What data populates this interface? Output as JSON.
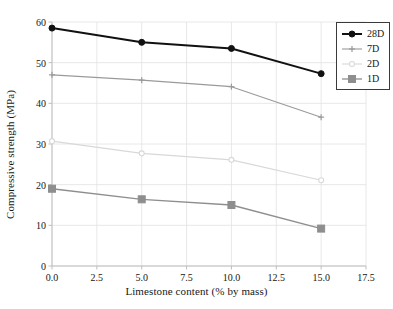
{
  "chart_data": {
    "type": "line",
    "title": "",
    "xlabel": "Limestone content (% by mass)",
    "ylabel": "Compressive strength (MPa)",
    "x": [
      0,
      5,
      10,
      15
    ],
    "xlim": [
      0,
      17.5
    ],
    "ylim": [
      0,
      60
    ],
    "xticks": [
      "0.0",
      "2.5",
      "5.0",
      "7.5",
      "10.0",
      "12.5",
      "15.0",
      "17.5"
    ],
    "xtick_values": [
      0,
      2.5,
      5,
      7.5,
      10,
      12.5,
      15,
      17.5
    ],
    "yticks": [
      "0",
      "10",
      "20",
      "30",
      "40",
      "50",
      "60"
    ],
    "ytick_values": [
      0,
      10,
      20,
      30,
      40,
      50,
      60
    ],
    "grid": true,
    "legend_position": "upper right",
    "series": [
      {
        "name": "28D",
        "values": [
          58.5,
          55.0,
          53.5,
          47.3
        ],
        "color": "#111111",
        "marker": "circle",
        "line_width": 2.0,
        "marker_size": 6
      },
      {
        "name": "7D",
        "values": [
          47.0,
          45.7,
          44.1,
          36.6
        ],
        "color": "#9a9a9a",
        "marker": "plus",
        "line_width": 1.1,
        "marker_size": 6
      },
      {
        "name": "2D",
        "values": [
          30.7,
          27.7,
          26.1,
          21.1
        ],
        "color": "#d8d8d8",
        "marker": "circle-open",
        "line_width": 1.1,
        "marker_size": 5
      },
      {
        "name": "1D",
        "values": [
          19.0,
          16.4,
          15.0,
          9.2
        ],
        "color": "#8e8e8e",
        "marker": "square",
        "line_width": 1.3,
        "marker_size": 7
      }
    ]
  },
  "legend": {
    "entries": [
      {
        "label": "28D"
      },
      {
        "label": "7D"
      },
      {
        "label": "2D"
      },
      {
        "label": "1D"
      }
    ]
  },
  "style": {
    "background": "#ffffff",
    "grid_color": "#e2e2e2",
    "axis_color": "#bfbfbf",
    "text_color": "#171717"
  }
}
